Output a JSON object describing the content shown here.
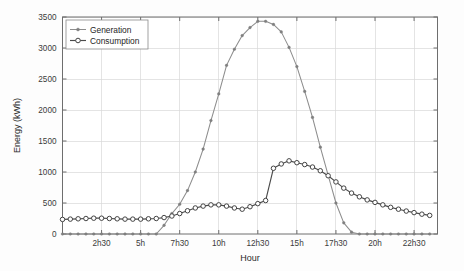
{
  "chart_data": {
    "type": "line",
    "title": "",
    "xlabel": "Hour",
    "ylabel": "Energy (kWh)",
    "ylim": [
      0,
      3500
    ],
    "yticks": [
      0,
      500,
      1000,
      1500,
      2000,
      2500,
      3000,
      3500
    ],
    "ytick_labels": [
      "0",
      "500",
      "1000",
      "1500",
      "2000",
      "2500",
      "3000",
      "3500"
    ],
    "xlim": [
      0,
      24
    ],
    "xticks": [
      2.5,
      5,
      7.5,
      10,
      12.5,
      15,
      17.5,
      20,
      22.5
    ],
    "xtick_labels": [
      "2h30",
      "5h",
      "7h30",
      "10h",
      "12h30",
      "15h",
      "17h30",
      "20h",
      "22h30"
    ],
    "grid": true,
    "legend_position": "upper-left",
    "x": [
      0,
      0.5,
      1,
      1.5,
      2,
      2.5,
      3,
      3.5,
      4,
      4.5,
      5,
      5.5,
      6,
      6.5,
      7,
      7.5,
      8,
      8.5,
      9,
      9.5,
      10,
      10.5,
      11,
      11.5,
      12,
      12.5,
      13,
      13.5,
      14,
      14.5,
      15,
      15.5,
      16,
      16.5,
      17,
      17.5,
      18,
      18.5,
      19,
      19.5,
      20,
      20.5,
      21,
      21.5,
      22,
      22.5,
      23,
      23.5
    ],
    "series": [
      {
        "name": "Generation",
        "color": "#8d8d8d",
        "marker": "filled-circle",
        "values": [
          0,
          0,
          0,
          0,
          0,
          0,
          0,
          0,
          0,
          0,
          0,
          0,
          0,
          140,
          330,
          480,
          700,
          1000,
          1370,
          1830,
          2260,
          2720,
          2980,
          3200,
          3330,
          3430,
          3430,
          3380,
          3260,
          3010,
          2700,
          2300,
          1880,
          1400,
          950,
          500,
          180,
          30,
          0,
          0,
          0,
          0,
          0,
          0,
          0,
          0,
          0,
          0
        ]
      },
      {
        "name": "Consumption",
        "color": "#4a4a4a",
        "marker": "open-circle",
        "values": [
          235,
          240,
          245,
          250,
          255,
          255,
          250,
          245,
          240,
          240,
          240,
          245,
          250,
          265,
          290,
          330,
          375,
          420,
          450,
          470,
          470,
          450,
          420,
          400,
          440,
          490,
          540,
          570,
          590,
          615,
          620,
          600,
          575,
          555,
          545,
          540,
          530,
          500,
          470,
          455,
          465,
          500,
          560,
          640,
          720,
          800,
          880,
          960
        ]
      }
    ],
    "consumption_extra": [
      1060,
      1130,
      1180,
      1150,
      1120,
      1080,
      1020,
      940,
      840,
      740,
      660,
      600,
      550,
      510,
      470,
      430,
      400,
      370,
      345,
      320,
      300
    ]
  },
  "legend": {
    "entries": [
      {
        "label": "Generation"
      },
      {
        "label": "Consumption"
      }
    ]
  },
  "axes": {
    "x_title": "Hour",
    "y_title": "Energy (kWh)"
  }
}
